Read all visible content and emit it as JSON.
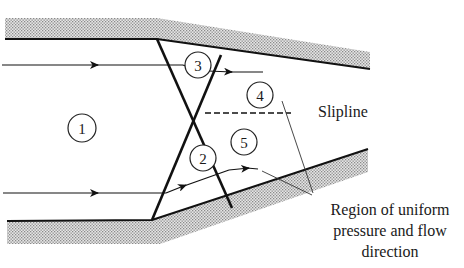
{
  "figure": {
    "type": "oblique shock reflection / regular intersection in a converging channel",
    "regions": [
      {
        "id": "1",
        "label": "1"
      },
      {
        "id": "2",
        "label": "2"
      },
      {
        "id": "3",
        "label": "3"
      },
      {
        "id": "4",
        "label": "4"
      },
      {
        "id": "5",
        "label": "5"
      }
    ],
    "annotations": {
      "slipline": "Slipline",
      "uniform_region_line1": "Region of uniform",
      "uniform_region_line2": "pressure and flow",
      "uniform_region_line3": "direction"
    },
    "colors": {
      "line": "#111111",
      "hatch": "#b8b8b8",
      "background": "#ffffff"
    }
  }
}
